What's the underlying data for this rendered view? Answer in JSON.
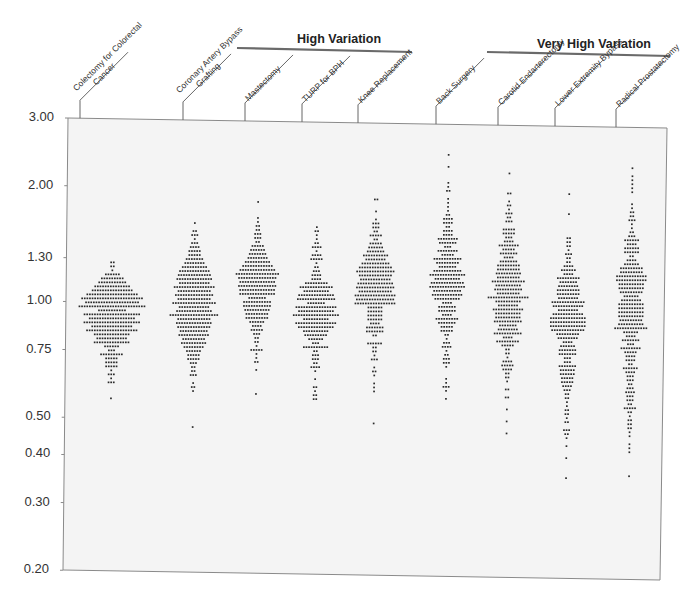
{
  "chart_data": {
    "type": "scatter",
    "subtype": "dot-strip (beeswarm) plot",
    "title": "",
    "ylabel": "",
    "xlabel": "",
    "yscale": "log",
    "ylim": [
      0.2,
      3.0
    ],
    "y_ticks": [
      "3.00",
      "2.00",
      "1.30",
      "1.00",
      "0.75",
      "0.50",
      "0.40",
      "0.30",
      "0.20"
    ],
    "grid": false,
    "legend": null,
    "groups": [
      {
        "name": "High Variation",
        "columns": [
          "Mastectomy",
          "TURP for BPH",
          "Knee Replacement"
        ]
      },
      {
        "name": "Very High Variation",
        "columns": [
          "Carotid Endarterectomy",
          "Lower Extremity Bypass",
          "Radical Prostatectomy"
        ]
      }
    ],
    "categories": [
      "Colectomy for Colorectal Cancer",
      "Coronary Artery Bypass Grafting",
      "Mastectomy",
      "TURP for BPH",
      "Knee Replacement",
      "Back Surgery",
      "Carotid Endarterectomy",
      "Lower Extremity Bypass",
      "Radical Prostatectomy"
    ],
    "series": [
      {
        "name": "Colectomy for Colorectal Cancer",
        "min": 0.6,
        "max": 1.27,
        "median": 1.0,
        "top": 1.27,
        "rows": [
          2,
          2,
          1,
          6,
          9,
          11,
          14,
          16,
          20,
          24,
          21,
          26,
          11,
          22,
          18,
          22,
          16,
          20,
          14,
          12,
          14,
          6,
          3,
          9,
          5,
          5,
          5,
          1,
          3,
          1,
          3,
          0,
          0,
          0,
          1
        ]
      },
      {
        "name": "Coronary Artery Bypass Grafting",
        "min": 0.47,
        "max": 1.62,
        "median": 1.0,
        "top": 1.62,
        "rows": [
          1,
          0,
          2,
          3,
          1,
          3,
          4,
          5,
          5,
          7,
          8,
          10,
          12,
          13,
          14,
          12,
          16,
          13,
          15,
          13,
          17,
          12,
          14,
          19,
          13,
          14,
          13,
          11,
          12,
          9,
          10,
          8,
          6,
          5,
          5,
          3,
          2,
          2,
          3,
          0,
          1,
          2,
          1,
          0,
          0,
          0,
          0,
          0,
          0,
          0,
          0,
          1
        ]
      },
      {
        "name": "Mastectomy",
        "min": 0.46,
        "max": 1.85,
        "median": 0.98,
        "top": 1.85,
        "rows": [
          1,
          0,
          0,
          0,
          1,
          1,
          2,
          2,
          3,
          3,
          2,
          5,
          6,
          7,
          8,
          10,
          12,
          14,
          17,
          15,
          14,
          15,
          14,
          14,
          7,
          11,
          11,
          10,
          9,
          9,
          6,
          4,
          5,
          3,
          2,
          2,
          1,
          5,
          1,
          1,
          2,
          0,
          1,
          0,
          0,
          0,
          0,
          0,
          1
        ]
      },
      {
        "name": "TURP for BPH",
        "min": 0.52,
        "max": 1.6,
        "median": 0.98,
        "top": 1.6,
        "rows": [
          1,
          2,
          1,
          1,
          2,
          4,
          1,
          4,
          5,
          1,
          2,
          3,
          4,
          4,
          9,
          13,
          10,
          14,
          15,
          7,
          16,
          14,
          18,
          10,
          16,
          14,
          10,
          9,
          6,
          3,
          10,
          2,
          3,
          3,
          2,
          4,
          1,
          0,
          1,
          0,
          2,
          1,
          2,
          2
        ]
      },
      {
        "name": "Knee Replacement",
        "min": 0.36,
        "max": 1.9,
        "median": 0.96,
        "top": 1.9,
        "rows": [
          2,
          0,
          0,
          1,
          0,
          1,
          3,
          3,
          2,
          5,
          2,
          5,
          6,
          7,
          10,
          8,
          11,
          13,
          15,
          13,
          12,
          14,
          15,
          13,
          16,
          15,
          16,
          6,
          6,
          6,
          6,
          4,
          7,
          7,
          2,
          0,
          6,
          2,
          2,
          1,
          3,
          0,
          1,
          2,
          1,
          0,
          1,
          1,
          1,
          0,
          0,
          0,
          0,
          0,
          0,
          0,
          1
        ]
      },
      {
        "name": "Back Surgery",
        "min": 0.41,
        "max": 2.5,
        "median": 1.0,
        "top": 2.5,
        "rows": [
          1,
          0,
          0,
          1,
          0,
          0,
          0,
          1,
          1,
          2,
          0,
          1,
          1,
          1,
          1,
          2,
          4,
          4,
          2,
          4,
          4,
          8,
          7,
          3,
          8,
          5,
          11,
          9,
          7,
          11,
          14,
          10,
          13,
          14,
          11,
          12,
          10,
          4,
          7,
          7,
          4,
          9,
          7,
          5,
          5,
          2,
          1,
          3,
          4,
          1,
          2,
          3,
          3,
          1,
          0,
          0,
          1,
          1,
          3,
          1,
          0,
          1
        ]
      },
      {
        "name": "Carotid Endarterectomy",
        "min": 0.31,
        "max": 2.25,
        "median": 0.95,
        "top": 2.25,
        "rows": [
          1,
          0,
          0,
          0,
          0,
          2,
          0,
          1,
          2,
          1,
          3,
          2,
          3,
          0,
          5,
          5,
          3,
          4,
          8,
          5,
          7,
          4,
          7,
          9,
          9,
          10,
          9,
          13,
          10,
          11,
          9,
          16,
          10,
          8,
          12,
          10,
          10,
          11,
          7,
          8,
          11,
          4,
          9,
          5,
          2,
          2,
          1,
          4,
          5,
          4,
          2,
          2,
          1,
          0,
          2,
          0,
          2,
          0,
          0,
          1,
          0,
          0,
          1,
          0,
          0,
          1
        ]
      },
      {
        "name": "Lower Extremity Bypass",
        "min": 0.27,
        "max": 2.0,
        "median": 0.97,
        "top": 2.0,
        "rows": [
          1,
          0,
          0,
          0,
          0,
          1,
          0,
          0,
          0,
          0,
          0,
          2,
          2,
          2,
          1,
          3,
          2,
          2,
          4,
          6,
          4,
          9,
          7,
          8,
          9,
          9,
          8,
          13,
          12,
          8,
          12,
          14,
          14,
          14,
          13,
          9,
          8,
          4,
          6,
          7,
          7,
          3,
          3,
          7,
          6,
          6,
          5,
          5,
          4,
          3,
          2,
          2,
          1,
          1,
          2,
          2,
          1,
          2,
          0,
          3,
          2,
          1,
          0,
          1,
          0,
          0,
          1,
          0,
          0,
          0,
          0,
          1
        ]
      },
      {
        "name": "Radical Prostatectomy",
        "min": 0.23,
        "max": 2.35,
        "median": 0.95,
        "top": 2.35,
        "rows": [
          1,
          0,
          1,
          1,
          1,
          1,
          1,
          0,
          0,
          1,
          1,
          2,
          2,
          3,
          1,
          1,
          2,
          3,
          6,
          4,
          6,
          6,
          2,
          4,
          6,
          9,
          9,
          12,
          12,
          10,
          10,
          9,
          6,
          8,
          10,
          10,
          10,
          10,
          9,
          10,
          13,
          6,
          4,
          7,
          3,
          8,
          5,
          4,
          4,
          2,
          6,
          4,
          3,
          3,
          2,
          3,
          4,
          3,
          3,
          2,
          5,
          2,
          1,
          2,
          2,
          2,
          1,
          1,
          0,
          1,
          1,
          1,
          0,
          0,
          0,
          0,
          0,
          1
        ]
      }
    ]
  },
  "axis": {
    "y_labels": [
      {
        "text": "3.00",
        "value": 3.0
      },
      {
        "text": "2.00",
        "value": 2.0
      },
      {
        "text": "1.30",
        "value": 1.3
      },
      {
        "text": "1.00",
        "value": 1.0
      },
      {
        "text": "0.75",
        "value": 0.75
      },
      {
        "text": "0.50",
        "value": 0.5
      },
      {
        "text": "0.40",
        "value": 0.4
      },
      {
        "text": "0.30",
        "value": 0.3
      },
      {
        "text": "0.20",
        "value": 0.2
      }
    ]
  },
  "header": {
    "group_high": "High Variation",
    "group_very_high": "Very High Variation",
    "columns": [
      {
        "line1": "Colectomy for Colorectal",
        "line2": "Cancer"
      },
      {
        "line1": "Coronary Artery Bypass",
        "line2": "Grafting"
      },
      {
        "line1": "Mastectomy",
        "line2": ""
      },
      {
        "line1": "TURP for BPH",
        "line2": ""
      },
      {
        "line1": "Knee Replacement",
        "line2": ""
      },
      {
        "line1": "Back Surgery",
        "line2": ""
      },
      {
        "line1": "Carotid Endarterectomy",
        "line2": ""
      },
      {
        "line1": "Lower Extremity Bypass",
        "line2": ""
      },
      {
        "line1": "Radical Prostatectomy",
        "line2": ""
      }
    ]
  },
  "colors": {
    "plot_bg": "#f4f4f4",
    "plot_border": "#8a8a8a",
    "dot": "#2a2a2a",
    "group_rule": "#6a6a6a",
    "text": "#222222"
  }
}
